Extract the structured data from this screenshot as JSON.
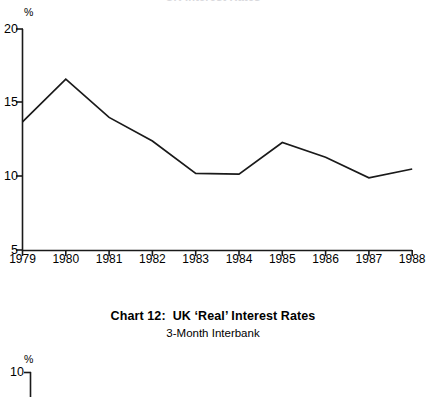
{
  "clipped_heading": "UK Interest Rates",
  "caption": {
    "chart_number": "Chart 12:",
    "title": "UK ‘Real’ Interest Rates",
    "subtitle": "3-Month Interbank"
  },
  "chart_data": [
    {
      "type": "line",
      "title": "",
      "subtitle": "",
      "xlabel": "",
      "ylabel": "%",
      "unit_label": "%",
      "categories": [
        "1979",
        "1980",
        "1981",
        "1982",
        "1983",
        "1984",
        "1985",
        "1986",
        "1987",
        "1988"
      ],
      "x": [
        1979,
        1980,
        1981,
        1982,
        1983,
        1984,
        1985,
        1986,
        1987,
        1988
      ],
      "values": [
        13.7,
        16.6,
        14.0,
        12.4,
        10.2,
        10.15,
        12.3,
        11.3,
        9.9,
        10.5
      ],
      "yticks": [
        20,
        15,
        10,
        5
      ],
      "ytick_labels": [
        "20",
        "15",
        "10",
        "5"
      ],
      "ylim": [
        5,
        20
      ],
      "xlim": [
        1979,
        1988
      ],
      "grid": false,
      "legend": "none",
      "line_color": "#1a1a1a",
      "axis_color": "#1a1a1a"
    },
    {
      "type": "line",
      "title": "",
      "subtitle": "",
      "xlabel": "",
      "ylabel": "%",
      "unit_label": "%",
      "categories": [],
      "values": [],
      "yticks": [
        10
      ],
      "ytick_labels": [
        "10"
      ],
      "ylim": [
        null,
        10
      ],
      "grid": false,
      "legend": "none",
      "note": "partially visible chart cropped at bottom edge",
      "line_color": "#1a1a1a",
      "axis_color": "#1a1a1a"
    }
  ]
}
